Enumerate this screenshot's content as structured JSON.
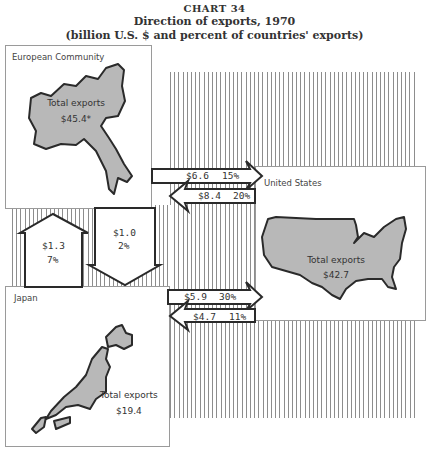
{
  "title": {
    "chart_number": "CHART 34",
    "heading": "Direction of exports, 1970",
    "subheading": "(billion U.S. $ and percent of countries' exports)"
  },
  "regions": {
    "ec": {
      "name": "European Community",
      "total_label": "Total exports",
      "total_value": "$45.4*"
    },
    "us": {
      "name": "United States",
      "total_label": "Total exports",
      "total_value": "$42.7"
    },
    "japan": {
      "name": "Japan",
      "total_label": "Total exports",
      "total_value": "$19.4"
    }
  },
  "flows": {
    "ec_to_us": {
      "value": "$6.6",
      "percent": "15%"
    },
    "us_to_ec": {
      "value": "$8.4",
      "percent": "20%"
    },
    "japan_to_ec": {
      "value": "$1.3",
      "percent": "7%"
    },
    "ec_to_japan": {
      "value": "$1.0",
      "percent": "2%"
    },
    "japan_to_us": {
      "value": "$5.9",
      "percent": "30%"
    },
    "us_to_japan": {
      "value": "$4.7",
      "percent": "11%"
    }
  },
  "colors": {
    "map_fill": "#b8b8b8",
    "outline": "#2a2a2a",
    "hatch": "#8d8d8d"
  }
}
